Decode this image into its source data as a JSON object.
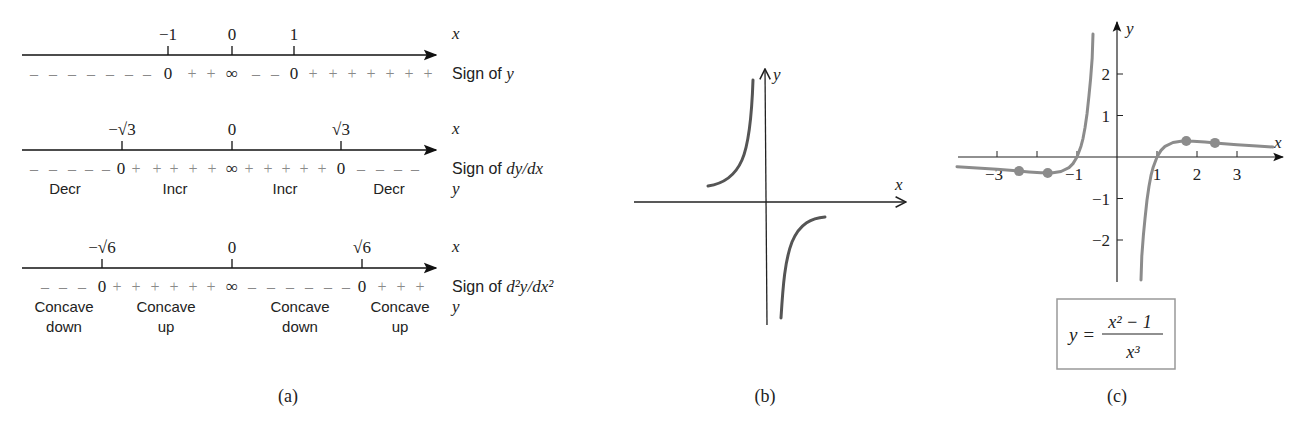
{
  "figure": {
    "captions": {
      "a": "(a)",
      "b": "(b)",
      "c": "(c)"
    }
  },
  "panel_a": {
    "lines": [
      {
        "axis_label": "x",
        "ticks": [
          {
            "label": "−1",
            "x": 168
          },
          {
            "label": "0",
            "x": 232
          },
          {
            "label": "1",
            "x": 294
          }
        ],
        "row_label": "Sign of y",
        "signs": [
          {
            "t": "–",
            "x": 34
          },
          {
            "t": "–",
            "x": 53
          },
          {
            "t": "–",
            "x": 72
          },
          {
            "t": "–",
            "x": 91
          },
          {
            "t": "–",
            "x": 110
          },
          {
            "t": "–",
            "x": 129
          },
          {
            "t": "–",
            "x": 147
          },
          {
            "t": "0",
            "x": 168
          },
          {
            "t": "+",
            "x": 192
          },
          {
            "t": "+",
            "x": 211
          },
          {
            "t": "∞",
            "x": 232
          },
          {
            "t": "–",
            "x": 256
          },
          {
            "t": "–",
            "x": 275
          },
          {
            "t": "0",
            "x": 294
          },
          {
            "t": "+",
            "x": 313
          },
          {
            "t": "+",
            "x": 333
          },
          {
            "t": "+",
            "x": 352
          },
          {
            "t": "+",
            "x": 371
          },
          {
            "t": "+",
            "x": 390
          },
          {
            "t": "+",
            "x": 409
          },
          {
            "t": "+",
            "x": 428
          }
        ],
        "regions": []
      },
      {
        "axis_label": "x",
        "ticks": [
          {
            "label": "−√3",
            "x": 122
          },
          {
            "label": "0",
            "x": 232
          },
          {
            "label": "√3",
            "x": 341
          }
        ],
        "row_label": "Sign of dy/dx",
        "signs": [
          {
            "t": "–",
            "x": 34
          },
          {
            "t": "–",
            "x": 53
          },
          {
            "t": "–",
            "x": 72
          },
          {
            "t": "–",
            "x": 89
          },
          {
            "t": "–",
            "x": 106
          },
          {
            "t": "0",
            "x": 121
          },
          {
            "t": "+",
            "x": 136
          },
          {
            "t": "+",
            "x": 157
          },
          {
            "t": "+",
            "x": 174
          },
          {
            "t": "+",
            "x": 193
          },
          {
            "t": "+",
            "x": 212
          },
          {
            "t": "∞",
            "x": 232
          },
          {
            "t": "+",
            "x": 249
          },
          {
            "t": "+",
            "x": 268
          },
          {
            "t": "+",
            "x": 286
          },
          {
            "t": "+",
            "x": 304
          },
          {
            "t": "+",
            "x": 322
          },
          {
            "t": "0",
            "x": 341
          },
          {
            "t": "–",
            "x": 361
          },
          {
            "t": "–",
            "x": 380
          },
          {
            "t": "–",
            "x": 398
          },
          {
            "t": "–",
            "x": 415
          }
        ],
        "regions": [
          {
            "label": "Decr",
            "x": 65
          },
          {
            "label": "Incr",
            "x": 175
          },
          {
            "label": "Incr",
            "x": 285
          },
          {
            "label": "Decr",
            "x": 389
          }
        ],
        "region_axis_label": "y"
      },
      {
        "axis_label": "x",
        "ticks": [
          {
            "label": "−√6",
            "x": 102
          },
          {
            "label": "0",
            "x": 232
          },
          {
            "label": "√6",
            "x": 362
          }
        ],
        "row_label": "Sign of d²y/dx²",
        "signs": [
          {
            "t": "–",
            "x": 45
          },
          {
            "t": "–",
            "x": 63
          },
          {
            "t": "–",
            "x": 82
          },
          {
            "t": "0",
            "x": 102
          },
          {
            "t": "+",
            "x": 117
          },
          {
            "t": "+",
            "x": 136
          },
          {
            "t": "+",
            "x": 155
          },
          {
            "t": "+",
            "x": 174
          },
          {
            "t": "+",
            "x": 193
          },
          {
            "t": "+",
            "x": 211
          },
          {
            "t": "∞",
            "x": 232
          },
          {
            "t": "–",
            "x": 252
          },
          {
            "t": "–",
            "x": 271
          },
          {
            "t": "–",
            "x": 290
          },
          {
            "t": "–",
            "x": 309
          },
          {
            "t": "–",
            "x": 328
          },
          {
            "t": "–",
            "x": 346
          },
          {
            "t": "0",
            "x": 362
          },
          {
            "t": "+",
            "x": 382
          },
          {
            "t": "+",
            "x": 401
          },
          {
            "t": "+",
            "x": 420
          }
        ],
        "regions": [
          {
            "label": "Concave",
            "label2": "down",
            "x": 64
          },
          {
            "label": "Concave",
            "label2": "up",
            "x": 166
          },
          {
            "label": "Concave",
            "label2": "down",
            "x": 300
          },
          {
            "label": "Concave",
            "label2": "up",
            "x": 400
          }
        ],
        "region_axis_label": "y"
      }
    ]
  },
  "panel_b": {
    "x_label": "x",
    "y_label": "y",
    "description": "Hand-drawn sketch of y=(x²−1)/x³ near the origin"
  },
  "chart_data": {
    "type": "line",
    "xlabel": "x",
    "ylabel": "y",
    "xlim": [
      -4.0,
      4.0
    ],
    "ylim": [
      -3.0,
      3.0
    ],
    "x_ticks": [
      -3,
      -2,
      -1,
      1,
      2,
      3
    ],
    "x_tick_labels": [
      "−3",
      "",
      "−1",
      "1",
      "2",
      "3"
    ],
    "y_ticks": [
      -2,
      -1,
      1,
      2
    ],
    "y_tick_labels": [
      "−2",
      "−1",
      "1",
      "2"
    ],
    "grid": false,
    "series": [
      {
        "name": "y = (x²−1)/x³",
        "x": [
          -4.0,
          -3.5,
          -3.0,
          -2.6,
          -2.2,
          -1.9,
          -1.6,
          -1.4,
          -1.2,
          -1.1,
          -1.0,
          -0.9,
          -0.85,
          -0.8,
          -0.75,
          -0.7,
          -0.66,
          -0.62,
          -0.6
        ],
        "y": [
          -0.234,
          -0.262,
          -0.296,
          -0.327,
          -0.36,
          -0.379,
          -0.381,
          -0.35,
          -0.255,
          -0.158,
          0.0,
          0.261,
          0.443,
          0.703,
          1.037,
          1.487,
          1.881,
          2.391,
          2.963
        ]
      },
      {
        "name": "y = (x²−1)/x³",
        "x": [
          0.6,
          0.62,
          0.66,
          0.7,
          0.75,
          0.8,
          0.85,
          0.9,
          1.0,
          1.1,
          1.2,
          1.4,
          1.6,
          1.9,
          2.2,
          2.6,
          3.0,
          3.5,
          3.9
        ],
        "y": [
          -2.963,
          -2.391,
          -1.881,
          -1.487,
          -1.037,
          -0.703,
          -0.443,
          -0.261,
          0.0,
          0.158,
          0.255,
          0.35,
          0.381,
          0.379,
          0.36,
          0.327,
          0.296,
          0.262,
          0.24
        ]
      }
    ],
    "marked_points": [
      {
        "x": -2.449,
        "y": -0.34,
        "note": "inflection (−√6)"
      },
      {
        "x": -1.732,
        "y": -0.385,
        "note": "local min (−√3)"
      },
      {
        "x": 1.732,
        "y": 0.385,
        "note": "local max (√3)"
      },
      {
        "x": 2.449,
        "y": 0.34,
        "note": "inflection (√6)"
      }
    ],
    "formula_box": {
      "lhs": "y =",
      "numerator": "x² − 1",
      "denominator": "x³"
    },
    "colors": {
      "curve": "#8c8c8c",
      "axis": "#222222",
      "box": "#999999"
    }
  }
}
